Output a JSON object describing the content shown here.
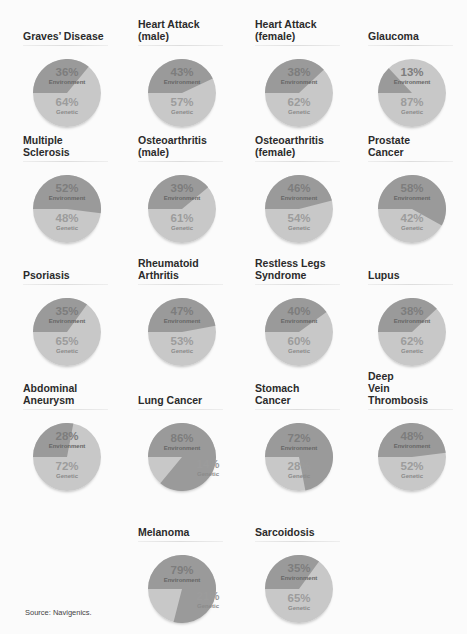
{
  "chart_data": {
    "type": "pie",
    "title": "",
    "legend": [
      "Environment",
      "Genetic"
    ],
    "colors": {
      "environment": "#9a9a9a",
      "genetic": "#c9c9c9"
    },
    "charts": [
      {
        "title": "Graves' Disease",
        "environment": 36,
        "genetic": 64
      },
      {
        "title": "Heart Attack (male)",
        "environment": 43,
        "genetic": 57
      },
      {
        "title": "Heart Attack (female)",
        "environment": 38,
        "genetic": 62
      },
      {
        "title": "Glaucoma",
        "environment": 13,
        "genetic": 87
      },
      {
        "title": "Multiple Sclerosis",
        "environment": 52,
        "genetic": 48
      },
      {
        "title": "Osteoarthritis (male)",
        "environment": 39,
        "genetic": 61
      },
      {
        "title": "Osteoarthritis (female)",
        "environment": 46,
        "genetic": 54
      },
      {
        "title": "Prostate Cancer",
        "environment": 58,
        "genetic": 42
      },
      {
        "title": "Psoriasis",
        "environment": 35,
        "genetic": 65
      },
      {
        "title": "Rheumatoid Arthritis",
        "environment": 47,
        "genetic": 53
      },
      {
        "title": "Restless Legs Syndrome",
        "environment": 40,
        "genetic": 60
      },
      {
        "title": "Lupus",
        "environment": 38,
        "genetic": 62
      },
      {
        "title": "Abdominal Aneurysm",
        "environment": 28,
        "genetic": 72
      },
      {
        "title": "Lung Cancer",
        "environment": 86,
        "genetic": 14
      },
      {
        "title": "Stomach Cancer",
        "environment": 72,
        "genetic": 28
      },
      {
        "title": "Deep Vein Thrombosis",
        "environment": 48,
        "genetic": 52
      },
      {
        "title": "Melanoma",
        "environment": 79,
        "genetic": 21
      },
      {
        "title": "Sarcoidosis",
        "environment": 35,
        "genetic": 65
      }
    ]
  },
  "labels": {
    "environment": "Environment",
    "genetic": "Genetic"
  },
  "pies": [
    {
      "title": "Graves’ Disease",
      "env": "36%",
      "gen": "64%"
    },
    {
      "title": "Heart Attack\n(male)",
      "env": "43%",
      "gen": "57%"
    },
    {
      "title": "Heart Attack\n(female)",
      "env": "38%",
      "gen": "62%"
    },
    {
      "title": "Glaucoma",
      "env": "13%",
      "gen": "87%"
    },
    {
      "title": "Multiple\nSclerosis",
      "env": "52%",
      "gen": "48%"
    },
    {
      "title": "Osteoarthritis\n(male)",
      "env": "39%",
      "gen": "61%"
    },
    {
      "title": "Osteoarthritis\n(female)",
      "env": "46%",
      "gen": "54%"
    },
    {
      "title": "Prostate\nCancer",
      "env": "58%",
      "gen": "42%"
    },
    {
      "title": "Psoriasis",
      "env": "35%",
      "gen": "65%"
    },
    {
      "title": "Rheumatoid\nArthritis",
      "env": "47%",
      "gen": "53%"
    },
    {
      "title": "Restless Legs\nSyndrome",
      "env": "40%",
      "gen": "60%"
    },
    {
      "title": "Lupus",
      "env": "38%",
      "gen": "62%"
    },
    {
      "title": "Abdominal\nAneurysm",
      "env": "28%",
      "gen": "72%"
    },
    {
      "title": "Lung Cancer",
      "env": "86%",
      "gen": "14%"
    },
    {
      "title": "Stomach\nCancer",
      "env": "72%",
      "gen": "28%"
    },
    {
      "title": "Deep\nVein\nThrombosis",
      "env": "48%",
      "gen": "52%"
    },
    {
      "title": "Melanoma",
      "env": "79%",
      "gen": "21%"
    },
    {
      "title": "Sarcoidosis",
      "env": "35%",
      "gen": "65%"
    }
  ],
  "source": "Source: Navigenics."
}
